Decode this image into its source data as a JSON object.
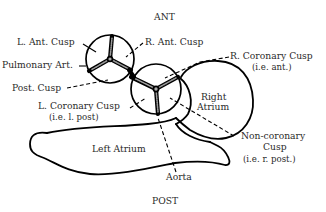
{
  "diagram": {
    "orientation": {
      "top": "ANT",
      "bottom": "POST"
    },
    "pulmonary_valve": {
      "labels": {
        "left_anterior_cusp": "L. Ant. Cusp",
        "right_anterior_cusp": "R. Ant. Cusp",
        "pulmonary_artery": "Pulmonary Art.",
        "posterior_cusp": "Post. Cusp"
      }
    },
    "aortic_valve": {
      "labels": {
        "right_coronary_cusp": "R. Coronary Cusp",
        "right_coronary_cusp_note": "(i.e. ant.)",
        "left_coronary_cusp": "L. Coronary Cusp",
        "left_coronary_cusp_note": "(i.e. l. post)",
        "non_coronary_cusp_line1": "Non-coronary",
        "non_coronary_cusp_line2": "Cusp",
        "non_coronary_cusp_note": "(i.e. r. post.)",
        "aorta": "Aorta"
      }
    },
    "chambers": {
      "right_atrium_line1": "Right",
      "right_atrium_line2": "Atrium",
      "left_atrium": "Left Atrium"
    },
    "colors": {
      "line": "#000000",
      "text": "#2a2a2a",
      "background": "#ffffff"
    }
  }
}
